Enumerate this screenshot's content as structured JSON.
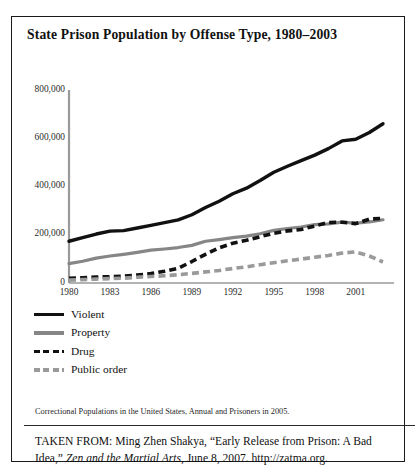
{
  "frame": {
    "border_color": "#1a1a1a"
  },
  "title": "State Prison Population by Offense Type, 1980–2003",
  "legend": [
    {
      "label": "Violent",
      "color": "#111111",
      "style": "solid"
    },
    {
      "label": "Property",
      "color": "#868686",
      "style": "solid"
    },
    {
      "label": "Drug",
      "color": "#111111",
      "style": "dashed"
    },
    {
      "label": "Public order",
      "color": "#9a9a9a",
      "style": "dashed"
    }
  ],
  "source_note": "Correctional Populations in the United States, Annual and Prisoners in 2005.",
  "attribution": {
    "prefix": "TAKEN FROM: Ming Zhen Shakya, “Early Release from Prison: A Bad Idea,” ",
    "italic": "Zen and the Martial Arts",
    "suffix": ", June 8, 2007. http://zatma.org."
  },
  "chart_data": {
    "type": "line",
    "title": "State Prison Population by Offense Type, 1980–2003",
    "xlabel": "",
    "ylabel": "",
    "xlim": [
      1980,
      2003
    ],
    "ylim": [
      0,
      800000
    ],
    "grid": false,
    "legend_position": "below-left",
    "ytick_labels": [
      "0",
      "200,000",
      "400,000",
      "600,000",
      "800,000"
    ],
    "ytick_values": [
      0,
      200000,
      400000,
      600000,
      800000
    ],
    "xtick_labels": [
      "1980",
      "1983",
      "1986",
      "1989",
      "1992",
      "1995",
      "1998",
      "2001"
    ],
    "xtick_values": [
      1980,
      1983,
      1986,
      1989,
      1992,
      1995,
      1998,
      2001
    ],
    "x": [
      1980,
      1981,
      1982,
      1983,
      1984,
      1985,
      1986,
      1987,
      1988,
      1989,
      1990,
      1991,
      1992,
      1993,
      1994,
      1995,
      1996,
      1997,
      1998,
      1999,
      2000,
      2001,
      2002,
      2003
    ],
    "series": [
      {
        "name": "Violent",
        "color": "#111111",
        "style": "solid",
        "values": [
          173000,
          188000,
          203000,
          215000,
          217000,
          228000,
          239000,
          250000,
          262000,
          283000,
          313000,
          339000,
          370000,
          393000,
          425000,
          459000,
          484000,
          507000,
          530000,
          557000,
          589000,
          596000,
          624000,
          660000
        ]
      },
      {
        "name": "Property",
        "color": "#868686",
        "style": "solid",
        "values": [
          80000,
          90000,
          103000,
          112000,
          119000,
          127000,
          136000,
          141000,
          147000,
          156000,
          173000,
          180000,
          188000,
          194000,
          204000,
          218000,
          226000,
          232000,
          242000,
          245000,
          252000,
          248000,
          253000,
          262000
        ]
      },
      {
        "name": "Drug",
        "color": "#111111",
        "style": "dashed",
        "values": [
          19000,
          22000,
          25000,
          26000,
          28000,
          33000,
          39000,
          49000,
          61000,
          89000,
          119000,
          146000,
          165000,
          177000,
          192000,
          206000,
          216000,
          222000,
          236000,
          251000,
          252000,
          246000,
          265000,
          268000
        ]
      },
      {
        "name": "Public order",
        "color": "#9a9a9a",
        "style": "dashed",
        "values": [
          12000,
          14000,
          16000,
          18000,
          20000,
          24000,
          27000,
          30000,
          34000,
          40000,
          46000,
          52000,
          60000,
          67000,
          76000,
          84000,
          92000,
          99000,
          107000,
          114000,
          124000,
          129000,
          112000,
          87000
        ]
      }
    ]
  }
}
